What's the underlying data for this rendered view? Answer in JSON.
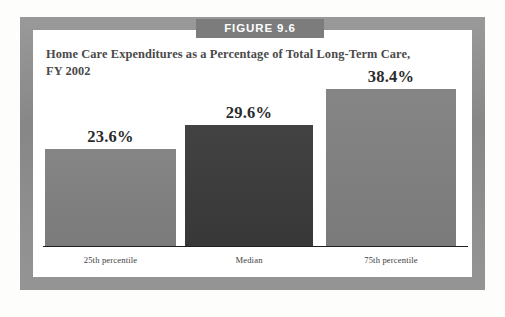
{
  "figure": {
    "badge_label": "FIGURE 9.6",
    "title_line1": "Home Care Expenditures as a Percentage of Total Long-Term Care,",
    "title_line2": "FY 2002"
  },
  "colors": {
    "frame": "#8e8e8e",
    "badge_bg": "#7c7c7c",
    "badge_text": "#ffffff",
    "title_text": "#4a4a4a",
    "bar_light": "#808080",
    "bar_dark": "#3a3a3a",
    "axis_line": "#1f1f1f",
    "plate_bg": "#ffffff"
  },
  "chart_data": {
    "type": "bar",
    "title": "Home Care Expenditures as a Percentage of Total Long-Term Care, FY 2002",
    "xlabel": "",
    "ylabel": "",
    "ylim": [
      0,
      43
    ],
    "grid": false,
    "legend": "none",
    "categories": [
      "25th percentile",
      "Median",
      "75th percentile"
    ],
    "values": [
      23.6,
      29.6,
      38.4
    ],
    "value_labels": [
      "23.6%",
      "29.6%",
      "38.4%"
    ],
    "bar_colors": [
      "#808080",
      "#3a3a3a",
      "#808080"
    ]
  }
}
